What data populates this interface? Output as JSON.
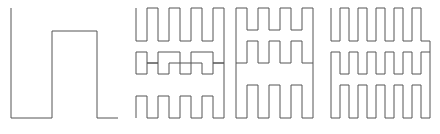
{
  "figure": {
    "panel_count": 4,
    "background_color": "#ffffff",
    "stroke_color": "#555555",
    "stroke_width": 1,
    "canvas": {
      "width": 440,
      "height": 134
    }
  },
  "chart_data": {
    "type": "line",
    "subtitle": "",
    "xlabel": "",
    "ylabel": "",
    "grid": false,
    "legend_position": "none",
    "axes_visible": false,
    "tick_labels_x": [],
    "tick_labels_y": [],
    "annotations": [],
    "xlim": [
      0,
      440
    ],
    "ylim": [
      0,
      134
    ],
    "y_axis_inverted": true,
    "series": [
      {
        "name": "iteration-1",
        "order": 1,
        "stroke": "#555555",
        "bbox": [
          11,
          8,
          118,
          118
        ],
        "x": [
          11,
          11,
          52,
          52,
          97,
          97,
          118
        ],
        "y": [
          8,
          118,
          118,
          31,
          31,
          118,
          118
        ]
      },
      {
        "name": "iteration-2",
        "order": 2,
        "stroke": "#555555",
        "bbox": [
          136,
          8,
          219,
          118
        ],
        "x": [
          136,
          136,
          153,
          153,
          163,
          163,
          181,
          181,
          192,
          192,
          208,
          208,
          219,
          219,
          208,
          208,
          192,
          192,
          181,
          181,
          163,
          163,
          153,
          153,
          136,
          136,
          153,
          153,
          163,
          163,
          181,
          181,
          192,
          192,
          208,
          208,
          219
        ],
        "y": [
          8,
          41,
          41,
          8,
          8,
          41,
          41,
          8,
          8,
          41,
          41,
          8,
          8,
          63,
          63,
          41,
          41,
          63,
          63,
          41,
          41,
          63,
          63,
          41,
          41,
          85,
          85,
          63,
          63,
          85,
          85,
          63,
          63,
          85,
          85,
          63,
          63
        ]
      },
      {
        "name": "iteration-3",
        "order": 3,
        "stroke": "#555555",
        "bbox": [
          236,
          8,
          320,
          118
        ],
        "x": [
          236,
          236,
          253,
          253,
          264,
          264,
          281,
          281,
          292,
          292,
          309,
          309,
          320
        ],
        "y": [
          30,
          8,
          8,
          41,
          41,
          8,
          8,
          41,
          41,
          8,
          8,
          30,
          30
        ]
      },
      {
        "name": "iteration-4",
        "order": 4,
        "stroke": "#555555",
        "bbox": [
          331,
          8,
          430,
          118
        ],
        "x": [
          331,
          331,
          344,
          344,
          352,
          352,
          365,
          365,
          373,
          373,
          386,
          386,
          394,
          394,
          407,
          407,
          415,
          415,
          430
        ],
        "y": [
          8,
          41,
          41,
          8,
          8,
          41,
          41,
          8,
          8,
          41,
          41,
          8,
          8,
          41,
          41,
          8,
          8,
          41,
          41
        ]
      }
    ],
    "paths": [
      {
        "name": "panel-1-curve",
        "label": "Iteration 1",
        "d": "M 11 8 L 11 118 L 52 118 L 52 31 L 97 31 L 97 118 L 118 118"
      },
      {
        "name": "panel-2-curve",
        "label": "Iteration 2",
        "d": "M 136 8 L 136 41 L 153 41 L 153 8 L 163 8 L 163 41 L 181 41 L 181 8 L 192 8 L 192 41 L 208 41 L 208 8 L 219 8 L 219 63 L 208 63 L 208 41 L 192 41 L 192 63 L 181 63 L 181 41 L 163 41 L 163 63 L 153 63 L 153 41 L 136 41 L 136 63 L 136 85 L 153 85 L 153 63 L 163 63 L 163 85 L 181 85 L 181 63 L 192 63 L 192 85 L 208 85 L 208 63 L 219 63"
      }
    ],
    "values_note": "Curve vertices in pixel coordinates of the 440x134 canvas; y increases downward."
  },
  "panels": [
    {
      "name": "panel-1",
      "label": "Iteration 1",
      "x": 0,
      "y": 0,
      "width": 130,
      "height": 134,
      "d": "M 11 8 L 11 118 L 52 118 L 52 31 L 97 31 L 97 118 L 118 118"
    },
    {
      "name": "panel-2",
      "label": "Iteration 2",
      "x": 130,
      "y": 0,
      "width": 100,
      "height": 134,
      "d": "M 136 8 L 136 41 L 147 41 L 147 8 L 158 8 L 158 41 L 169 41 L 169 8 L 180 8 L 180 41 L 191 41 L 191 8 L 202 8 L 202 41 L 213 41 L 213 8 L 224 8 L 224 63 L 213 63 L 213 52 L 191 52 L 191 63 L 180 63 L 180 52 L 158 52 L 158 63 L 147 63 L 147 52 L 136 52 L 136 74 L 147 74 L 147 63 L 158 63 L 158 74 L 169 74 L 169 63 L 180 63 L 180 74 L 191 74 L 191 63 L 202 63 L 202 74 L 213 74 L 213 63 L 224 63 L 224 118 L 213 118 L 213 96 L 202 96 L 202 118 L 191 118 L 191 96 L 180 96 L 180 118 L 169 118 L 169 96 L 158 96 L 158 118 L 147 118 L 147 96 L 136 96 L 136 118"
    },
    {
      "name": "panel-3",
      "label": "Iteration 3",
      "x": 230,
      "y": 0,
      "width": 95,
      "height": 134,
      "d": "M 236 8 L 236 63 L 247 63 L 247 41 L 258 41 L 258 63 L 269 63 L 269 41 L 280 41 L 280 63 L 291 63 L 291 41 L 302 41 L 302 63 L 313 63 L 313 8 L 302 8 L 302 30 L 291 30 L 291 8 L 280 8 L 280 30 L 269 30 L 269 8 L 258 8 L 258 30 L 247 30 L 247 8 L 236 8 M 236 63 L 236 118 L 247 118 L 247 85 L 258 85 L 258 118 L 269 118 L 269 85 L 280 85 L 280 118 L 291 118 L 291 85 L 302 85 L 302 118 L 313 118 L 313 63"
    },
    {
      "name": "panel-4",
      "label": "Iteration 4",
      "x": 325,
      "y": 0,
      "width": 115,
      "height": 134,
      "d": "M 331 8 L 331 41 L 340 41 L 340 8 L 349 8 L 349 41 L 358 41 L 358 8 L 367 8 L 367 41 L 376 41 L 376 8 L 385 8 L 385 41 L 394 41 L 394 8 L 403 8 L 403 41 L 412 41 L 412 8 L 421 8 L 421 41 L 430 41 L 430 118 L 421 118 L 421 85 L 412 85 L 412 118 L 403 118 L 403 85 L 394 85 L 394 118 L 385 118 L 385 85 L 376 85 L 376 118 L 367 118 L 367 85 L 358 85 L 358 118 L 349 118 L 349 85 L 340 85 L 340 118 L 331 118 L 331 52 L 340 52 L 340 74 L 349 74 L 349 52 L 358 52 L 358 74 L 367 74 L 367 52 L 376 52 L 376 74 L 385 74 L 385 52 L 394 52 L 394 74 L 403 74 L 403 52 L 412 52 L 412 74 L 421 74 L 421 52 L 430 52"
    }
  ]
}
